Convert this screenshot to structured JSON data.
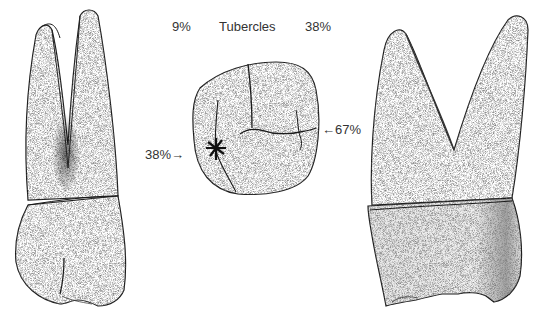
{
  "figure": {
    "type": "dental-illustration",
    "teeth": [
      {
        "id": "left-tooth",
        "view": "lateral-view-two-roots"
      },
      {
        "id": "center-tooth",
        "view": "occlusal-view"
      },
      {
        "id": "right-tooth",
        "view": "lateral-view-two-roots"
      }
    ],
    "labels": {
      "top_left_pct": "9%",
      "top_title": "Tubercles",
      "top_right_pct": "38%",
      "left_pct": "38%→",
      "right_pct": "←67%"
    },
    "colors": {
      "ink": "#1a1a1a",
      "stipple": "#555555",
      "background": "#ffffff"
    }
  }
}
